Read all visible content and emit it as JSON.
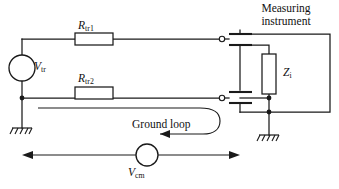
{
  "figure": {
    "kind": "circuit-schematic",
    "title_text": "",
    "background_color": "#ffffff",
    "line_color": "#1a1a1a",
    "width_px": 339,
    "height_px": 189
  },
  "labels": {
    "measuring_instrument_line1": "Measuring",
    "measuring_instrument_line2": "instrument",
    "resistor_top": "R",
    "resistor_top_sub": "tr1",
    "resistor_bottom": "R",
    "resistor_bottom_sub": "tr2",
    "source_transducer": "V",
    "source_transducer_sub": "tr",
    "input_impedance": "Z",
    "input_impedance_sub": "i",
    "ground_loop": "Ground loop",
    "source_common_mode": "V",
    "source_common_mode_sub": "cm"
  },
  "components": {
    "voltage_source_transducer": {
      "name": "V_tr",
      "shape": "circle",
      "cx": 22,
      "cy": 68,
      "r": 13
    },
    "voltage_source_common_mode": {
      "name": "V_cm",
      "shape": "circle",
      "cx": 147,
      "cy": 155,
      "r": 11
    },
    "resistor_top": {
      "name": "R_tr1",
      "shape": "rectangle",
      "x": 75,
      "y": 33,
      "width": 38,
      "height": 12
    },
    "resistor_bottom": {
      "name": "R_tr2",
      "shape": "rectangle",
      "x": 75,
      "y": 87,
      "width": 38,
      "height": 12
    },
    "input_impedance": {
      "name": "Z_i",
      "shape": "rectangle",
      "x": 262,
      "y": 54,
      "width": 14,
      "height": 40
    },
    "terminal_top": {
      "name": "input-terminal-top",
      "cx": 222,
      "cy": 39,
      "r": 2.6
    },
    "terminal_bottom": {
      "name": "input-terminal-bottom",
      "cx": 222,
      "cy": 98,
      "r": 2.6
    },
    "ground_left": {
      "name": "ground-symbol-left",
      "x": 22,
      "y": 128
    },
    "ground_right": {
      "name": "ground-symbol-right",
      "x": 256,
      "y": 135
    },
    "instrument_enclosure": {
      "name": "measuring-instrument-box",
      "x": 240,
      "y": 34,
      "width": 90,
      "height": 78
    }
  },
  "annotations": {
    "ground_loop_arrow_direction": "counterclockwise-left",
    "common_mode_arrow_type": "double-headed",
    "common_mode_arrow_left_x": 22,
    "common_mode_arrow_right_x": 240,
    "common_mode_arrow_y": 155
  }
}
